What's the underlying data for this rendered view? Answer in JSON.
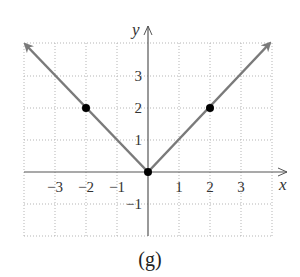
{
  "chart_data": {
    "type": "line",
    "title": "",
    "caption": "(g)",
    "xlabel": "x",
    "ylabel": "y",
    "function": "y = |x|",
    "xlim": [
      -4,
      4
    ],
    "ylim": [
      -2,
      4
    ],
    "grid": true,
    "grid_style": "dotted",
    "x_ticks": [
      -3,
      -2,
      -1,
      1,
      2,
      3
    ],
    "x_tick_labels": [
      "−3",
      "−2",
      "−1",
      "1",
      "2",
      "3"
    ],
    "y_ticks": [
      -1,
      1,
      2,
      3
    ],
    "y_tick_labels": [
      "−1",
      "1",
      "2",
      "3"
    ],
    "series": [
      {
        "name": "y=|x|",
        "x": [
          -4,
          -2,
          0,
          2,
          4
        ],
        "y": [
          4,
          2,
          0,
          2,
          4
        ],
        "arrows_at_ends": true,
        "color": "#7a7a7a"
      }
    ],
    "points": [
      {
        "x": -2,
        "y": 2
      },
      {
        "x": 0,
        "y": 0
      },
      {
        "x": 2,
        "y": 2
      }
    ],
    "point_color": "#000000"
  }
}
